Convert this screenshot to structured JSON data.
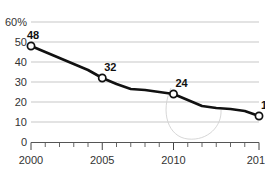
{
  "chart_data": {
    "type": "line",
    "title": "",
    "subtitle": "",
    "xlabel": "",
    "ylabel": "",
    "yunit": "%",
    "xlim": [
      2000,
      2016
    ],
    "ylim": [
      0,
      60
    ],
    "grid": true,
    "legend": null,
    "y_ticks": [
      "0",
      "10",
      "20",
      "30",
      "40",
      "50",
      "60%"
    ],
    "y_tick_values": [
      0,
      10,
      20,
      30,
      40,
      50,
      60
    ],
    "x_ticks": [
      "2000",
      "2005",
      "2010",
      "2016"
    ],
    "x_tick_values": [
      2000,
      2005,
      2010,
      2016
    ],
    "x_minor_ticks": [
      2001,
      2002,
      2003,
      2004,
      2006,
      2007,
      2008,
      2009,
      2011,
      2012,
      2013,
      2014,
      2015
    ],
    "series": [
      {
        "name": "value",
        "x": [
          2000,
          2001,
          2002,
          2003,
          2004,
          2005,
          2006,
          2007,
          2008,
          2009,
          2010,
          2011,
          2012,
          2013,
          2014,
          2015,
          2016
        ],
        "values": [
          48,
          45,
          42,
          39,
          36,
          32,
          29,
          26.5,
          26,
          25,
          24,
          21,
          18,
          17,
          16.5,
          15.5,
          13
        ]
      }
    ],
    "annotated_points": [
      {
        "x": 2000,
        "y": 48,
        "label": "48"
      },
      {
        "x": 2005,
        "y": 32,
        "label": "32"
      },
      {
        "x": 2010,
        "y": 24,
        "label": "24"
      },
      {
        "x": 2016,
        "y": 13,
        "label": "13"
      }
    ],
    "colors": {
      "line": "#111111",
      "marker_fill": "#ffffff",
      "marker_stroke": "#111111",
      "grid": "#b9b9b9",
      "axis": "#555555",
      "text": "#333333",
      "background": "#ffffff"
    }
  }
}
